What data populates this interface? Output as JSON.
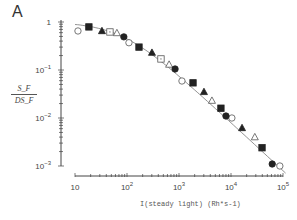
{
  "panel_label": "A",
  "y_axis_label": {
    "numerator": "S_F",
    "denominator": "DS_F"
  },
  "x_axis_label": "I(steady light) (Rh*s-1)",
  "chart_data": {
    "type": "scatter",
    "title": "",
    "panel": "A",
    "xlabel": "I(steady light) (Rh* s^-1)",
    "ylabel": "S_F / DS_F",
    "xscale": "log",
    "yscale": "log",
    "xlim": [
      10,
      100000
    ],
    "ylim": [
      0.001,
      1
    ],
    "x_ticks": [
      "10",
      "10^2",
      "10^3",
      "10^4",
      "10^5"
    ],
    "y_ticks": [
      "1",
      "10^-1",
      "10^-2",
      "10^-3"
    ],
    "grid": false,
    "legend": null,
    "fit_line": {
      "style": "solid thin",
      "description": "smooth curve through data, flat near 1 then declining with slope ~-1 on log-log"
    },
    "series": [
      {
        "name": "open circle",
        "marker": "circle-open",
        "points": [
          [
            11.4,
            0.65
          ],
          [
            109,
            0.37
          ],
          [
            1140,
            0.059
          ],
          [
            10400,
            0.01
          ],
          [
            87000,
            0.001
          ]
        ]
      },
      {
        "name": "filled square",
        "marker": "square-filled",
        "points": [
          [
            18.5,
            0.79
          ],
          [
            170,
            0.3
          ],
          [
            1860,
            0.054
          ],
          [
            6400,
            0.016
          ],
          [
            39500,
            0.0024
          ]
        ]
      },
      {
        "name": "filled triangle",
        "marker": "triangle-filled",
        "points": [
          [
            33,
            0.65
          ],
          [
            302,
            0.23
          ],
          [
            3020,
            0.035
          ],
          [
            16300,
            0.0062
          ]
        ]
      },
      {
        "name": "open square",
        "marker": "square-open",
        "points": [
          [
            47,
            0.62
          ],
          [
            450,
            0.17
          ]
        ]
      },
      {
        "name": "open triangle",
        "marker": "triangle-open",
        "points": [
          [
            64,
            0.59
          ],
          [
            645,
            0.13
          ],
          [
            4300,
            0.023
          ],
          [
            28700,
            0.004
          ]
        ]
      },
      {
        "name": "filled circle",
        "marker": "circle-filled",
        "points": [
          [
            87,
            0.49
          ],
          [
            840,
            0.105
          ],
          [
            8000,
            0.011
          ],
          [
            62000,
            0.0011
          ]
        ]
      }
    ]
  },
  "layout": {
    "x_px": {
      "logmin": 1,
      "px_at_logmin": 75,
      "px_per_decade": 52
    },
    "y_px": {
      "logmax": 0,
      "px_at_logmax": 22,
      "px_per_decade": 48
    },
    "x_axis_y": 176,
    "y_axis_x": 61
  }
}
